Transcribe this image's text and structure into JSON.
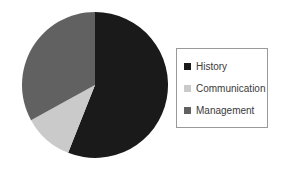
{
  "chart_data": {
    "type": "pie",
    "title": "",
    "subtitle": "",
    "xlabel": "",
    "ylabel": "",
    "grid": false,
    "legend_position": "right",
    "start_angle_deg": 0,
    "direction": "clockwise",
    "center": {
      "x": 95,
      "y": 85
    },
    "radius": 73,
    "categories": [
      "History",
      "Communication",
      "Management"
    ],
    "values": [
      56,
      11,
      33
    ],
    "units": "percent",
    "slices": [
      {
        "label": "History",
        "value": 56,
        "color": "#1a1a1a",
        "start_deg": 0,
        "end_deg": 201.6
      },
      {
        "label": "Communication",
        "value": 11,
        "color": "#cacaca",
        "start_deg": 201.6,
        "end_deg": 241.2
      },
      {
        "label": "Management",
        "value": 33,
        "color": "#616161",
        "start_deg": 241.2,
        "end_deg": 360
      }
    ],
    "annotations": []
  },
  "legend": {
    "items": [
      {
        "label": "History",
        "color": "#1a1a1a"
      },
      {
        "label": "Communication",
        "color": "#cacaca"
      },
      {
        "label": "Management",
        "color": "#616161"
      }
    ],
    "border_color": "#9a9a9a",
    "background": "#ffffff",
    "text_color": "#3a3a3a"
  },
  "canvas": {
    "background": "#ffffff",
    "width": 283,
    "height": 171
  }
}
